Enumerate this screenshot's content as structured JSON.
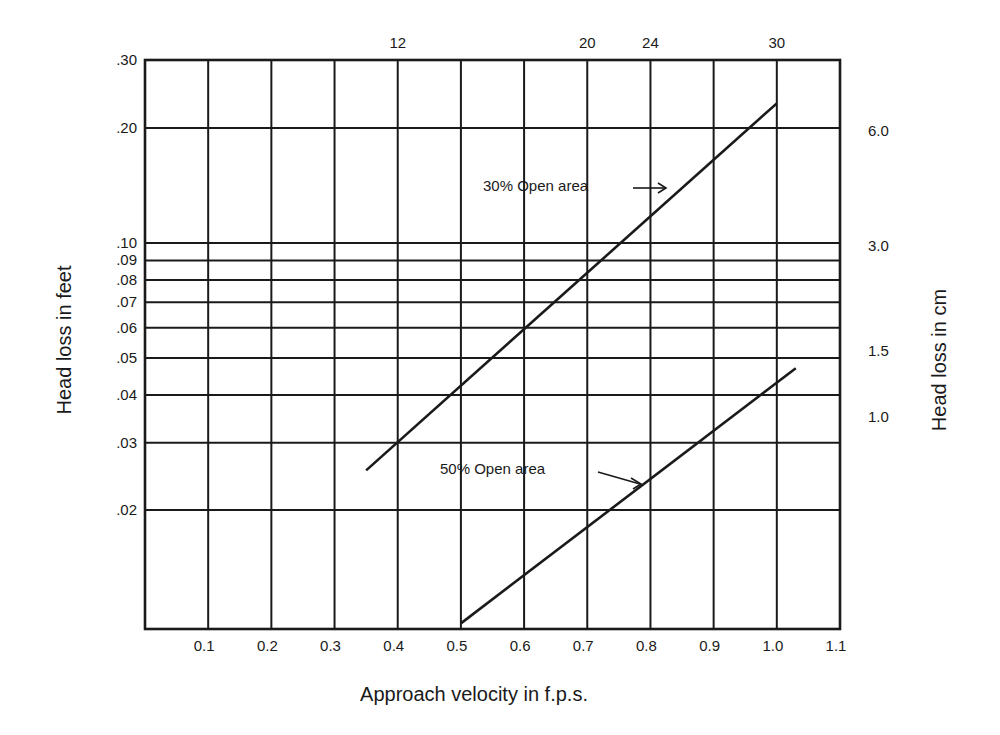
{
  "chart_data": {
    "type": "line",
    "title": "",
    "xlabel": "Approach velocity in f.p.s.",
    "ylabel": "Head loss in feet",
    "ylabel_right": "Head loss in cm",
    "x_scale": "linear",
    "y_scale": "log",
    "xlim": [
      0.0,
      1.1
    ],
    "ylim": [
      0.01,
      0.3
    ],
    "grid": true,
    "x_ticks": [
      "0.1",
      "0.2",
      "0.3",
      "0.4",
      "0.5",
      "0.6",
      "0.7",
      "0.8",
      "0.9",
      "1.0",
      "1.1"
    ],
    "x_tick_values": [
      0.1,
      0.2,
      0.3,
      0.4,
      0.5,
      0.6,
      0.7,
      0.8,
      0.9,
      1.0,
      1.1
    ],
    "y_ticks": [
      ".30",
      ".20",
      ".10",
      ".09",
      ".08",
      ".07",
      ".06",
      ".05",
      ".04",
      ".03",
      ".02"
    ],
    "y_tick_values": [
      0.3,
      0.2,
      0.1,
      0.09,
      0.08,
      0.07,
      0.06,
      0.05,
      0.04,
      0.03,
      0.02
    ],
    "top_ticks": [
      {
        "label": "12",
        "at_x": 0.4
      },
      {
        "label": "20",
        "at_x": 0.7
      },
      {
        "label": "24",
        "at_x": 0.8
      },
      {
        "label": "30",
        "at_x": 1.0
      }
    ],
    "right_ticks": [
      {
        "label": "6.0",
        "at_y": 0.197
      },
      {
        "label": "3.0",
        "at_y": 0.098
      },
      {
        "label": "1.5",
        "at_y": 0.052
      },
      {
        "label": "1.0",
        "at_y": 0.035
      }
    ],
    "series": [
      {
        "name": "30% Open area",
        "x": [
          0.35,
          1.0
        ],
        "y": [
          0.0254,
          0.232
        ]
      },
      {
        "name": "50% Open area",
        "x": [
          0.5,
          1.03
        ],
        "y": [
          0.0101,
          0.047
        ]
      }
    ],
    "annotations": [
      {
        "text": "30% Open area",
        "arrow_to": {
          "x": 0.86,
          "y": 0.137
        }
      },
      {
        "text": "50% Open area",
        "arrow_to": {
          "x": 0.79,
          "y": 0.0245
        }
      }
    ]
  }
}
